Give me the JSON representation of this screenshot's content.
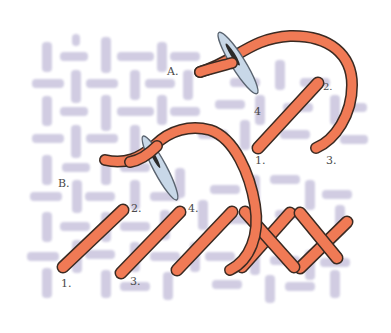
{
  "illustration": {
    "subject": "Stitch diagram on canvas mesh",
    "colors": {
      "background": "#ffffff",
      "canvas_mesh": "#c9c4de",
      "thread": "#f07a55",
      "thread_outline": "#3a2a22",
      "needle": "#c8d8e8",
      "needle_outline": "#5a6470",
      "label": "#4a4a4a"
    },
    "section_a": {
      "label": "A.",
      "numbers": {
        "n1": "1.",
        "n2": "2.",
        "n3": "3.",
        "n4": "4"
      }
    },
    "section_b": {
      "label": "B.",
      "numbers": {
        "n1": "1.",
        "n2": "2.",
        "n3": "3.",
        "n4": "4."
      }
    }
  }
}
